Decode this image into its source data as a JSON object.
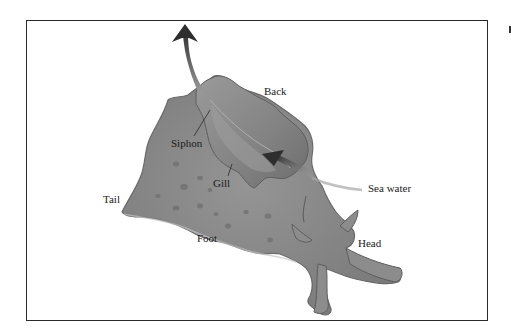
{
  "diagram": {
    "labels": {
      "back": "Back",
      "siphon": "Siphon",
      "gill": "Gill",
      "sea_water": "Sea water",
      "tail": "Tail",
      "foot": "Foot",
      "head": "Head"
    },
    "arrows": [
      {
        "name": "outflow-arrow",
        "direction": "up",
        "meaning": "water exits through siphon"
      },
      {
        "name": "inflow-arrow",
        "direction": "up-left",
        "meaning": "sea water enters toward gill"
      }
    ],
    "colors": {
      "body": "#8a8a8a",
      "body_dark": "#6e6e6e",
      "body_light": "#b4b4b4",
      "arrow": "#3a3a3a",
      "frame": "#2a2a2a"
    }
  }
}
